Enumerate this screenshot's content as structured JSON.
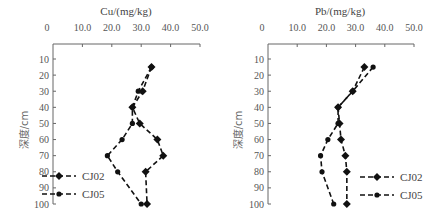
{
  "chart_data": [
    {
      "type": "line",
      "title": "Cu/(mg/kg)",
      "xlabel": "Cu/(mg/kg)",
      "ylabel": "深度/cm",
      "xlim": [
        0,
        50
      ],
      "ylim": [
        100,
        10
      ],
      "x_ticks": [
        "0",
        "10.0",
        "20.0",
        "30.0",
        "40.0",
        "50.0"
      ],
      "y_ticks": [
        "10",
        "20",
        "30",
        "40",
        "50",
        "60",
        "70",
        "80",
        "90",
        "100"
      ],
      "y": [
        15,
        30,
        40,
        50,
        60,
        70,
        80,
        100
      ],
      "series": [
        {
          "name": "CJ02",
          "marker": "diamond",
          "values": [
            33.5,
            30.5,
            27,
            29.5,
            35.5,
            37.5,
            31.5,
            32
          ]
        },
        {
          "name": "CJ05",
          "marker": "circle",
          "values": [
            33.5,
            29,
            27,
            27,
            23.5,
            18.5,
            22,
            30
          ]
        }
      ],
      "legend_position": "lower-left",
      "grid": false
    },
    {
      "type": "line",
      "title": "Pb/(mg/kg)",
      "xlabel": "Pb/(mg/kg)",
      "ylabel": "深度/cm",
      "xlim": [
        0,
        50
      ],
      "ylim": [
        100,
        10
      ],
      "x_ticks": [
        "0",
        "10.0",
        "20.0",
        "30.0",
        "40.0",
        "50.0"
      ],
      "y_ticks": [
        "10",
        "20",
        "30",
        "40",
        "50",
        "60",
        "70",
        "80",
        "90",
        "100"
      ],
      "y": [
        15,
        30,
        40,
        50,
        60,
        70,
        80,
        100
      ],
      "series": [
        {
          "name": "CJ02",
          "marker": "diamond",
          "values": [
            33,
            29,
            24,
            24.5,
            25,
            26.5,
            27,
            27
          ]
        },
        {
          "name": "CJ05",
          "marker": "circle",
          "values": [
            36,
            29,
            24,
            24,
            20.5,
            18,
            18.5,
            22.5
          ]
        }
      ],
      "legend_position": "lower-right",
      "grid": false
    }
  ],
  "charts": {
    "cu": {
      "title": "Cu/(mg/kg)",
      "ylabel": "深度/cm",
      "legend": [
        "CJ02",
        "CJ05"
      ]
    },
    "pb": {
      "title": "Pb/(mg/kg)",
      "ylabel": "深度/cm",
      "legend": [
        "CJ02",
        "CJ05"
      ]
    }
  }
}
